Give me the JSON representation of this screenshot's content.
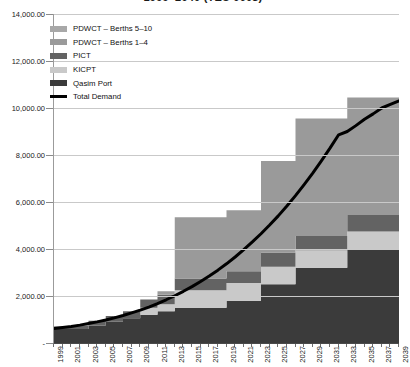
{
  "chart_data": {
    "type": "area",
    "title": "1999–2040 (TEU 000s)",
    "xlabel": "",
    "ylabel": "",
    "grid": true,
    "stacked": true,
    "legend_position": "top-left",
    "ylim": [
      0,
      14000
    ],
    "yticks": [
      0,
      2000,
      4000,
      6000,
      8000,
      10000,
      12000,
      14000
    ],
    "ytick_labels": [
      "-",
      "2,000.00",
      "4,000.00",
      "6,000.00",
      "8,000.00",
      "10,000.00",
      "12,000.00",
      "14,000.00"
    ],
    "x": [
      1999,
      2000,
      2001,
      2002,
      2003,
      2004,
      2005,
      2006,
      2007,
      2008,
      2009,
      2010,
      2011,
      2012,
      2013,
      2014,
      2015,
      2016,
      2017,
      2018,
      2019,
      2020,
      2021,
      2022,
      2023,
      2024,
      2025,
      2026,
      2027,
      2028,
      2029,
      2030,
      2031,
      2032,
      2033,
      2034,
      2035,
      2036,
      2037,
      2038,
      2039
    ],
    "xtick_labels": [
      "1999",
      "2001",
      "2003",
      "2005",
      "2007",
      "2009",
      "2011",
      "2013",
      "2015",
      "2017",
      "2019",
      "2021",
      "2023",
      "2025",
      "2027",
      "2029",
      "2031",
      "2033",
      "2035",
      "2037",
      "2039"
    ],
    "series": [
      {
        "name": "Qasim Port",
        "color": "#3b3b3b",
        "values": [
          600,
          600,
          600,
          600,
          750,
          750,
          900,
          900,
          1050,
          1050,
          1200,
          1200,
          1350,
          1350,
          1500,
          1500,
          1500,
          1500,
          1500,
          1500,
          1800,
          1800,
          1800,
          1800,
          2500,
          2500,
          2500,
          2500,
          3200,
          3200,
          3200,
          3200,
          3200,
          3200,
          4000,
          4000,
          4000,
          4000,
          4000,
          4000,
          4000
        ]
      },
      {
        "name": "KICPT",
        "color": "#c9c9c9",
        "values": [
          0,
          0,
          0,
          0,
          0,
          0,
          0,
          0,
          0,
          0,
          300,
          300,
          300,
          300,
          750,
          750,
          750,
          750,
          750,
          750,
          750,
          750,
          750,
          750,
          750,
          750,
          750,
          750,
          750,
          750,
          750,
          750,
          750,
          750,
          750,
          750,
          750,
          750,
          750,
          750,
          750
        ]
      },
      {
        "name": "PICT",
        "color": "#636363",
        "values": [
          100,
          100,
          150,
          150,
          200,
          200,
          250,
          250,
          300,
          300,
          350,
          350,
          400,
          400,
          500,
          500,
          500,
          500,
          500,
          500,
          500,
          500,
          500,
          500,
          600,
          600,
          600,
          600,
          600,
          600,
          600,
          600,
          600,
          600,
          700,
          700,
          700,
          700,
          700,
          700,
          700
        ]
      },
      {
        "name": "PDWCT – Berths 1–4",
        "color": "#9a9a9a",
        "values": [
          0,
          0,
          0,
          0,
          0,
          0,
          0,
          0,
          0,
          0,
          0,
          0,
          150,
          150,
          2600,
          2600,
          2600,
          2600,
          2600,
          2600,
          2600,
          2600,
          2600,
          2600,
          3900,
          3900,
          3900,
          3900,
          5000,
          5000,
          5000,
          5000,
          5000,
          5000,
          5000,
          5000,
          5000,
          5000,
          5000,
          5000,
          6100
        ]
      },
      {
        "name": "PDWCT – Berths 5–10",
        "color": "#a8a8a8",
        "values": [
          0,
          0,
          0,
          0,
          0,
          0,
          0,
          0,
          0,
          0,
          0,
          0,
          0,
          0,
          0,
          0,
          0,
          0,
          0,
          0,
          0,
          0,
          0,
          0,
          0,
          0,
          0,
          0,
          0,
          0,
          0,
          0,
          0,
          0,
          0,
          0,
          0,
          0,
          0,
          0,
          1250
        ]
      }
    ],
    "line_series": [
      {
        "name": "Total Demand",
        "color": "#000000",
        "values": [
          620,
          660,
          700,
          760,
          830,
          900,
          980,
          1070,
          1170,
          1280,
          1400,
          1530,
          1680,
          1840,
          2010,
          2200,
          2400,
          2620,
          2850,
          3100,
          3370,
          3660,
          3970,
          4300,
          4650,
          5020,
          5410,
          5830,
          6270,
          6740,
          7230,
          7750,
          8290,
          8860,
          9000,
          9250,
          9520,
          9750,
          10000,
          10150,
          10300
        ]
      }
    ]
  },
  "legend": {
    "items": [
      {
        "label": "PDWCT – Berths 5–10",
        "color": "#a8a8a8",
        "type": "swatch"
      },
      {
        "label": "PDWCT – Berths 1–4",
        "color": "#9a9a9a",
        "type": "swatch"
      },
      {
        "label": "PICT",
        "color": "#636363",
        "type": "swatch"
      },
      {
        "label": "KICPT",
        "color": "#c9c9c9",
        "type": "swatch"
      },
      {
        "label": "Qasim Port",
        "color": "#3b3b3b",
        "type": "swatch"
      },
      {
        "label": "Total Demand",
        "color": "#000000",
        "type": "line"
      }
    ]
  }
}
